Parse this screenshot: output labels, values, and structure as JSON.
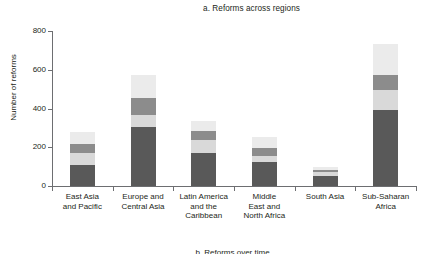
{
  "chart_data": {
    "type": "bar",
    "subtype": "stacked-bar",
    "title": "a. Reforms across regions",
    "xlabel": "",
    "ylabel": "Number of reforms",
    "ylim": [
      0,
      800
    ],
    "yticks": [
      0,
      200,
      400,
      600,
      800
    ],
    "ytick_labels": [
      "0",
      "200",
      "400",
      "600",
      "800"
    ],
    "grid": false,
    "legend": "none",
    "categories": [
      "East Asia and Pacific",
      "Europe and Central Asia",
      "Latin America and the Caribbean",
      "Middle East and North Africa",
      "South Asia",
      "Sub-Saharan Africa"
    ],
    "category_lines": [
      [
        "East Asia",
        "and Pacific"
      ],
      [
        "Europe and",
        "Central Asia"
      ],
      [
        "Latin America",
        "and the",
        "Caribbean"
      ],
      [
        "Middle",
        "East and",
        "North Africa"
      ],
      [
        "South Asia"
      ],
      [
        "Sub-Saharan",
        "Africa"
      ]
    ],
    "series": [
      {
        "name": "segment-1",
        "color": "#595959",
        "values": [
          110,
          305,
          168,
          125,
          50,
          390
        ]
      },
      {
        "name": "segment-2",
        "color": "#d9d9d9",
        "values": [
          60,
          60,
          67,
          30,
          20,
          105
        ]
      },
      {
        "name": "segment-3",
        "color": "#8c8c8c",
        "values": [
          45,
          90,
          50,
          40,
          15,
          80
        ]
      },
      {
        "name": "segment-4",
        "color": "#ebebeb",
        "values": [
          65,
          120,
          50,
          60,
          15,
          160
        ]
      }
    ],
    "totals": [
      280,
      575,
      335,
      255,
      100,
      735
    ]
  },
  "footer": {
    "partial_caption": "b. Reforms over time"
  },
  "colors": {
    "axis": "#6d6e71",
    "text": "#231f20",
    "background": "#ffffff"
  }
}
